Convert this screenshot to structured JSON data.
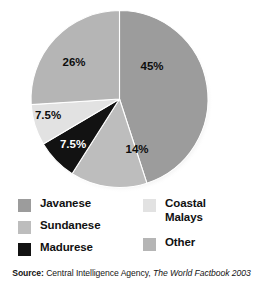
{
  "chart_data": {
    "type": "pie",
    "title": "",
    "subtitle": "",
    "xlabel": "",
    "ylabel": "",
    "legend_position": "bottom",
    "grid": false,
    "start_angle_deg": 0,
    "direction": "clockwise",
    "categories": [
      "Javanese",
      "Sundanese",
      "Madurese",
      "Coastal Malays",
      "Other"
    ],
    "values": [
      45,
      14,
      7.5,
      7.5,
      26
    ],
    "value_labels": [
      "45%",
      "14%",
      "7.5%",
      "7.5%",
      "26%"
    ],
    "colors": [
      "#9c9c9c",
      "#bdbdbd",
      "#121212",
      "#e2e2e2",
      "#b5b5b5"
    ],
    "label_text_colors": [
      "#0d0d0d",
      "#0d0d0d",
      "#ffffff",
      "#0d0d0d",
      "#0d0d0d"
    ],
    "slices": [
      {
        "name": "Javanese",
        "value": 45,
        "label": "45%",
        "color": "#9c9c9c",
        "start_deg": 0,
        "end_deg": 162,
        "label_x": 152,
        "label_y": 70,
        "label_light": false
      },
      {
        "name": "Sundanese",
        "value": 14,
        "label": "14%",
        "color": "#bdbdbd",
        "start_deg": 162,
        "end_deg": 212.4,
        "label_x": 137,
        "label_y": 153,
        "label_light": false
      },
      {
        "name": "Madurese",
        "value": 7.5,
        "label": "7.5%",
        "color": "#121212",
        "start_deg": 212.4,
        "end_deg": 239.4,
        "label_x": 73,
        "label_y": 148,
        "label_light": true
      },
      {
        "name": "Coastal Malays",
        "value": 7.5,
        "label": "7.5%",
        "color": "#e2e2e2",
        "start_deg": 239.4,
        "end_deg": 266.4,
        "label_x": 48,
        "label_y": 119,
        "label_light": false
      },
      {
        "name": "Other",
        "value": 26,
        "label": "26%",
        "color": "#b5b5b5",
        "start_deg": 266.4,
        "end_deg": 360,
        "label_x": 74,
        "label_y": 66,
        "label_light": false
      }
    ]
  },
  "legend": {
    "left_column": [
      {
        "label": "Javanese",
        "color": "#9c9c9c"
      },
      {
        "label": "Sundanese",
        "color": "#bdbdbd"
      },
      {
        "label": "Madurese",
        "color": "#121212"
      }
    ],
    "right_column": [
      {
        "label": "Coastal\nMalays",
        "color": "#e2e2e2"
      },
      {
        "label": "Other",
        "color": "#b5b5b5"
      }
    ]
  },
  "source": {
    "prefix": "Source:",
    "agency": "Central Intelligence Agency,",
    "publication": "The World Factbook 2003"
  }
}
